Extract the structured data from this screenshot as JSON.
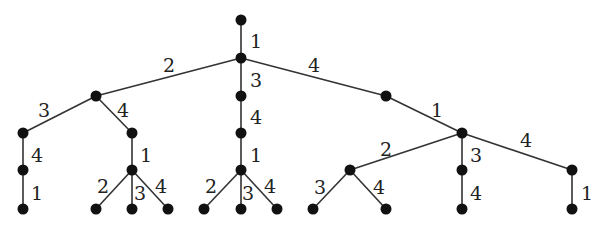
{
  "diagram": {
    "type": "labeled-tree",
    "colors": {
      "edge": "#333333",
      "node": "#111111",
      "label": "#222222",
      "background": "#ffffff"
    },
    "nodes": [
      {
        "id": "r",
        "x": 241,
        "y": 20
      },
      {
        "id": "a",
        "x": 241,
        "y": 58
      },
      {
        "id": "b",
        "x": 96,
        "y": 96
      },
      {
        "id": "c",
        "x": 241,
        "y": 96
      },
      {
        "id": "d",
        "x": 386,
        "y": 96
      },
      {
        "id": "b1",
        "x": 23,
        "y": 133
      },
      {
        "id": "b2",
        "x": 132,
        "y": 133
      },
      {
        "id": "c1",
        "x": 241,
        "y": 133
      },
      {
        "id": "e",
        "x": 462,
        "y": 133
      },
      {
        "id": "b1a",
        "x": 23,
        "y": 170
      },
      {
        "id": "b2a",
        "x": 132,
        "y": 170
      },
      {
        "id": "c1a",
        "x": 241,
        "y": 170
      },
      {
        "id": "e1",
        "x": 350,
        "y": 170
      },
      {
        "id": "e2",
        "x": 462,
        "y": 170
      },
      {
        "id": "e3",
        "x": 572,
        "y": 170
      },
      {
        "id": "l1",
        "x": 23,
        "y": 209
      },
      {
        "id": "l2",
        "x": 96,
        "y": 209
      },
      {
        "id": "l3",
        "x": 132,
        "y": 209
      },
      {
        "id": "l4",
        "x": 168,
        "y": 209
      },
      {
        "id": "l5",
        "x": 204,
        "y": 209
      },
      {
        "id": "l6",
        "x": 241,
        "y": 209
      },
      {
        "id": "l7",
        "x": 277,
        "y": 209
      },
      {
        "id": "l8",
        "x": 313,
        "y": 209
      },
      {
        "id": "l9",
        "x": 386,
        "y": 209
      },
      {
        "id": "l10",
        "x": 462,
        "y": 209
      },
      {
        "id": "l11",
        "x": 572,
        "y": 209
      }
    ],
    "edges": [
      {
        "from": "r",
        "to": "a",
        "label": "1",
        "lx": 250,
        "ly": 48
      },
      {
        "from": "a",
        "to": "b",
        "label": "2",
        "lx": 163,
        "ly": 72
      },
      {
        "from": "a",
        "to": "c",
        "label": "3",
        "lx": 250,
        "ly": 87
      },
      {
        "from": "a",
        "to": "d",
        "label": "4",
        "lx": 308,
        "ly": 72
      },
      {
        "from": "b",
        "to": "b1",
        "label": "3",
        "lx": 38,
        "ly": 117
      },
      {
        "from": "b",
        "to": "b2",
        "label": "4",
        "lx": 117,
        "ly": 117
      },
      {
        "from": "c",
        "to": "c1",
        "label": "4",
        "lx": 250,
        "ly": 124
      },
      {
        "from": "d",
        "to": "e",
        "label": "1",
        "lx": 431,
        "ly": 117
      },
      {
        "from": "b1",
        "to": "b1a",
        "label": "4",
        "lx": 31,
        "ly": 162
      },
      {
        "from": "b2",
        "to": "b2a",
        "label": "1",
        "lx": 140,
        "ly": 162
      },
      {
        "from": "c1",
        "to": "c1a",
        "label": "1",
        "lx": 250,
        "ly": 162
      },
      {
        "from": "e",
        "to": "e1",
        "label": "2",
        "lx": 380,
        "ly": 156
      },
      {
        "from": "e",
        "to": "e2",
        "label": "3",
        "lx": 470,
        "ly": 162
      },
      {
        "from": "e",
        "to": "e3",
        "label": "4",
        "lx": 520,
        "ly": 147
      },
      {
        "from": "b1a",
        "to": "l1",
        "label": "1",
        "lx": 31,
        "ly": 200
      },
      {
        "from": "b2a",
        "to": "l2",
        "label": "2",
        "lx": 97,
        "ly": 193
      },
      {
        "from": "b2a",
        "to": "l3",
        "label": "3",
        "lx": 134,
        "ly": 200
      },
      {
        "from": "b2a",
        "to": "l4",
        "label": "4",
        "lx": 155,
        "ly": 193
      },
      {
        "from": "c1a",
        "to": "l5",
        "label": "2",
        "lx": 205,
        "ly": 193
      },
      {
        "from": "c1a",
        "to": "l6",
        "label": "3",
        "lx": 242,
        "ly": 200
      },
      {
        "from": "c1a",
        "to": "l7",
        "label": "4",
        "lx": 264,
        "ly": 193
      },
      {
        "from": "e1",
        "to": "l8",
        "label": "3",
        "lx": 314,
        "ly": 194
      },
      {
        "from": "e1",
        "to": "l9",
        "label": "4",
        "lx": 373,
        "ly": 194
      },
      {
        "from": "e2",
        "to": "l10",
        "label": "4",
        "lx": 470,
        "ly": 200
      },
      {
        "from": "e3",
        "to": "l11",
        "label": "1",
        "lx": 581,
        "ly": 200
      }
    ]
  }
}
